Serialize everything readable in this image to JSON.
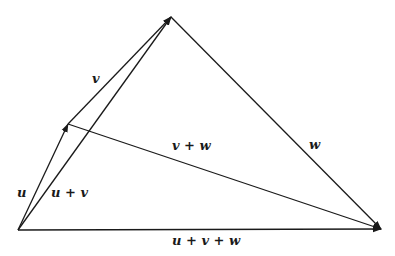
{
  "diagram": {
    "title": "",
    "stroke_color": "#1a1a1a",
    "background": "#ffffff",
    "points": {
      "origin": {
        "x": 18,
        "y": 230
      },
      "u_end": {
        "x": 68,
        "y": 124
      },
      "uv_end": {
        "x": 171,
        "y": 17
      },
      "uvw_end": {
        "x": 381,
        "y": 229
      }
    },
    "vectors": [
      {
        "id": "u",
        "from": "origin",
        "to": "u_end",
        "label": "u",
        "arrow": true
      },
      {
        "id": "v",
        "from": "u_end",
        "to": "uv_end",
        "label": "v",
        "arrow": true
      },
      {
        "id": "w",
        "from": "uv_end",
        "to": "uvw_end",
        "label": "w",
        "arrow": true
      },
      {
        "id": "u_plus_v",
        "from": "origin",
        "to": "uv_end",
        "label": "u + v",
        "arrow": true
      },
      {
        "id": "v_plus_w",
        "from": "u_end",
        "to": "uvw_end",
        "label": "v + w",
        "arrow": true
      },
      {
        "id": "u_plus_v_plus_w",
        "from": "origin",
        "to": "uvw_end",
        "label": "u + v + w",
        "arrow": true
      }
    ],
    "labels": {
      "u": "u",
      "v": "v",
      "w": "w",
      "u_plus_v": "u + v",
      "v_plus_w": "v + w",
      "u_plus_v_plus_w": "u + v + w"
    }
  }
}
